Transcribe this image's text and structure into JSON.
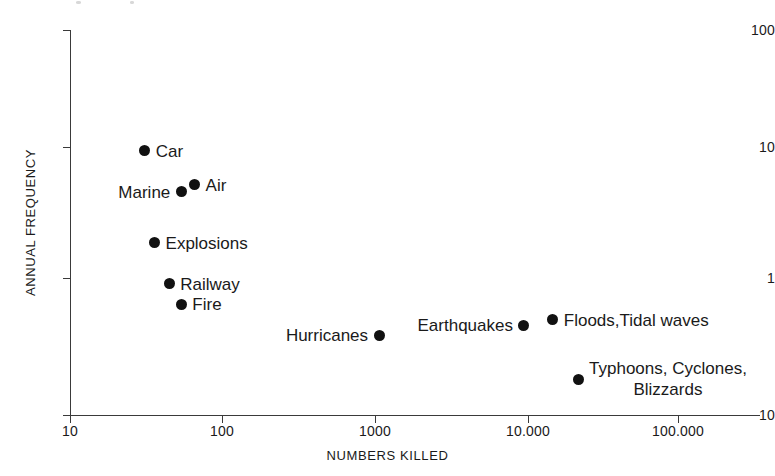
{
  "chart_data": {
    "type": "scatter",
    "title": "",
    "xlabel": "NUMBERS KILLED",
    "ylabel": "ANNUAL FREQUENCY",
    "xscale": "log",
    "yscale": "log",
    "xlim": [
      10,
      100000
    ],
    "ylim": [
      0.1,
      100
    ],
    "grid": false,
    "legend": "none",
    "xticks": [
      {
        "value": 10,
        "label": "10"
      },
      {
        "value": 100,
        "label": "100"
      },
      {
        "value": 1000,
        "label": "1000"
      },
      {
        "value": 10000,
        "label": "10.000"
      },
      {
        "value": 100000,
        "label": "100.000"
      }
    ],
    "yticks": [
      {
        "value": 100,
        "label": "100"
      },
      {
        "value": 10,
        "label": "10"
      },
      {
        "value": 1,
        "label": "1"
      },
      {
        "value": 0.1,
        "label": "10"
      }
    ],
    "points": [
      {
        "label": "Car",
        "x": 31,
        "y": 11.5,
        "label_side": "right"
      },
      {
        "label": "Marine",
        "x": 54,
        "y": 5.5,
        "label_side": "left"
      },
      {
        "label": "Air",
        "x": 66,
        "y": 6.2,
        "label_side": "right"
      },
      {
        "label": "Explosions",
        "x": 36,
        "y": 2.2,
        "label_side": "right"
      },
      {
        "label": "Railway",
        "x": 45,
        "y": 1.05,
        "label_side": "right"
      },
      {
        "label": "Fire",
        "x": 54,
        "y": 0.73,
        "label_side": "right"
      },
      {
        "label": "Hurricanes",
        "x": 1080,
        "y": 0.42,
        "label_side": "left"
      },
      {
        "label": "Earthquakes",
        "x": 9700,
        "y": 0.5,
        "label_side": "left"
      },
      {
        "label": "Floods,Tidal waves",
        "x": 15000,
        "y": 0.55,
        "label_side": "right"
      },
      {
        "label": "Typhoons, Cyclones,",
        "label2": "Blizzards",
        "x": 22000,
        "y": 0.19,
        "label_side": "right"
      }
    ]
  },
  "colors": {
    "marker": "#111111",
    "axis": "#3a3a3a",
    "text": "#1a1a1a",
    "background": "#ffffff"
  }
}
